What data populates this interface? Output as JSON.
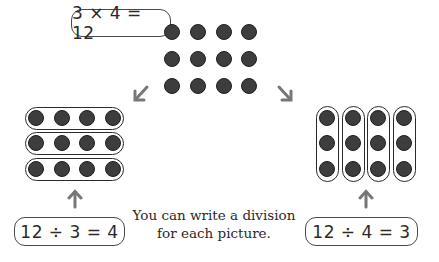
{
  "equations": {
    "multiplication": "3 × 4 = 12",
    "division_rows": "12 ÷ 3 = 4",
    "division_columns": "12 ÷ 4 = 3"
  },
  "caption": {
    "line1": "You can write a division",
    "line2": "for each picture."
  },
  "arrays": {
    "center": {
      "rows": 3,
      "columns": 4,
      "grouping": "none"
    },
    "left": {
      "rows": 3,
      "columns": 4,
      "grouping": "rows",
      "groups": 3
    },
    "right": {
      "rows": 3,
      "columns": 4,
      "grouping": "columns",
      "groups": 4
    }
  },
  "icons": {
    "arrow_left": "arrow-down-left-icon",
    "arrow_right": "arrow-down-right-icon",
    "arrow_up_left": "arrow-up-icon",
    "arrow_up_right": "arrow-up-icon"
  },
  "colors": {
    "dot_fill": "#3d3d3d",
    "outline": "#2a2a2a",
    "arrow": "#777777"
  }
}
